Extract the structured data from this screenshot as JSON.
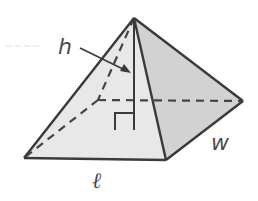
{
  "figure": {
    "type": "rectangular pyramid",
    "labels": {
      "height": "h",
      "width": "w",
      "length": "ℓ"
    },
    "faint_background_text": "~~~~",
    "colors": {
      "edge": "#3a3a3a",
      "front_face": "#e6e6e6",
      "right_face": "#cfcfcf",
      "label": "#4a4a4a",
      "background": "#ffffff"
    },
    "annotations": {
      "right_angle_marker": true,
      "height_arrow": true,
      "hidden_edges_dashed": true
    }
  }
}
